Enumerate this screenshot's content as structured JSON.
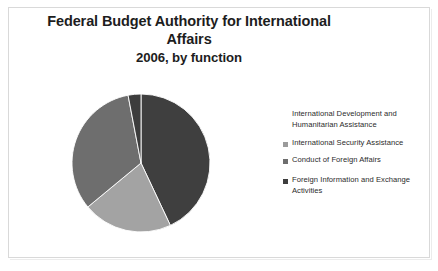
{
  "slide": {
    "background_color": "#ffffff",
    "border_color": "#d9d9d9"
  },
  "title": {
    "line1": "Federal Budget Authority for International",
    "line2": "Affairs",
    "line3": "2006, by function"
  },
  "chart_data": {
    "type": "pie",
    "title": "Federal Budget Authority for International Affairs 2006, by function",
    "subtitle": "2006, by function",
    "categories": [
      "International Development and Humanitarian Assistance",
      "International Security Assistance",
      "Conduct of Foreign Affairs",
      "Foreign Information and Exchange Activities"
    ],
    "values": [
      43,
      21,
      33,
      3
    ],
    "unit": "percent",
    "colors": [
      "#3f3f3f",
      "#a3a3a3",
      "#6e6e6e",
      "#3d3d3d"
    ],
    "legend_position": "right",
    "grid": false,
    "start_angle": 0,
    "direction": "clockwise"
  },
  "legend": {
    "items": [
      {
        "label": "International Development and Humanitarian Assistance",
        "swatch_color": "#ffffff",
        "marker_name": "legend-swatch-international-development"
      },
      {
        "label": "International Security Assistance",
        "swatch_color": "#9b9b9b",
        "marker_name": "legend-swatch-international-security"
      },
      {
        "label": "Conduct of Foreign Affairs",
        "swatch_color": "#6e6e6e",
        "marker_name": "legend-swatch-conduct-foreign-affairs"
      },
      {
        "label": "Foreign Information and Exchange Activities",
        "swatch_color": "#3d3d3d",
        "marker_name": "legend-swatch-foreign-information"
      }
    ]
  }
}
